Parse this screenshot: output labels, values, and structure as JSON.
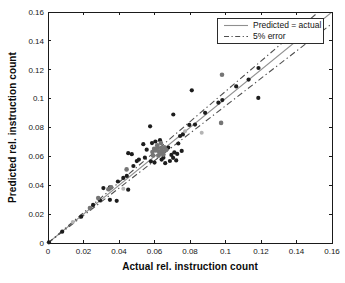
{
  "figure": {
    "xlabel": "Actual rel. instruction count",
    "ylabel": "Predicted rel. instruction count"
  },
  "legend": {
    "entries": [
      {
        "label": "Predicted = actual",
        "style": "solid"
      },
      {
        "label": "5% error",
        "style": "dashdot"
      }
    ]
  },
  "chart_data": {
    "type": "scatter",
    "title": "",
    "xlabel": "Actual rel. instruction count",
    "ylabel": "Predicted rel. instruction count",
    "xlim": [
      0,
      0.16
    ],
    "ylim": [
      0,
      0.16
    ],
    "grid": false,
    "legend_position": "top-right",
    "tick_values": [
      0,
      0.02,
      0.04,
      0.06,
      0.08,
      0.1,
      0.12,
      0.14,
      0.16
    ],
    "tick_labels": [
      "0",
      "0.02",
      "0.04",
      "0.06",
      "0.08",
      "0.1",
      "0.12",
      "0.14",
      "0.16"
    ],
    "lines": [
      {
        "name": "identity",
        "label": "Predicted = actual",
        "style": "solid",
        "slope": 1.0,
        "color": "#8f8f8f"
      },
      {
        "name": "plus-5pct",
        "label": "5% error",
        "style": "dashdot",
        "slope": 1.05,
        "color": "#4f4f4f"
      },
      {
        "name": "minus-5pct",
        "label": "5% error",
        "style": "dashdot",
        "slope": 0.95,
        "color": "#4f4f4f"
      }
    ],
    "point_colors": {
      "d": "#1d1d1d",
      "g": "#757575",
      "l": "#b4b4b4"
    },
    "point_radius": {
      "d": 2.1,
      "g": 2.3,
      "l": 2.0
    },
    "points": [
      [
        0.0005,
        0.0005,
        "d"
      ],
      [
        0.008,
        0.0078,
        "d"
      ],
      [
        0.0187,
        0.0182,
        "d"
      ],
      [
        0.0254,
        0.0264,
        "d"
      ],
      [
        0.0293,
        0.0296,
        "d"
      ],
      [
        0.0312,
        0.038,
        "d"
      ],
      [
        0.0349,
        0.0385,
        "d"
      ],
      [
        0.0349,
        0.0299,
        "d"
      ],
      [
        0.0387,
        0.0292,
        "d"
      ],
      [
        0.0452,
        0.0369,
        "d"
      ],
      [
        0.0394,
        0.0426,
        "d"
      ],
      [
        0.0424,
        0.0451,
        "d"
      ],
      [
        0.0444,
        0.0465,
        "d"
      ],
      [
        0.0452,
        0.0622,
        "d"
      ],
      [
        0.0472,
        0.0615,
        "d"
      ],
      [
        0.0481,
        0.0533,
        "d"
      ],
      [
        0.05,
        0.0567,
        "d"
      ],
      [
        0.0512,
        0.0578,
        "d"
      ],
      [
        0.0537,
        0.0684,
        "d"
      ],
      [
        0.0546,
        0.0591,
        "d"
      ],
      [
        0.0556,
        0.0646,
        "d"
      ],
      [
        0.058,
        0.0566,
        "d"
      ],
      [
        0.0586,
        0.0692,
        "d"
      ],
      [
        0.06,
        0.0557,
        "d"
      ],
      [
        0.0605,
        0.0703,
        "d"
      ],
      [
        0.0631,
        0.0712,
        "d"
      ],
      [
        0.064,
        0.0578,
        "d"
      ],
      [
        0.065,
        0.0591,
        "d"
      ],
      [
        0.066,
        0.0553,
        "d"
      ],
      [
        0.0678,
        0.0661,
        "d"
      ],
      [
        0.0687,
        0.0568,
        "d"
      ],
      [
        0.0695,
        0.061,
        "d"
      ],
      [
        0.0705,
        0.059,
        "d"
      ],
      [
        0.0712,
        0.0628,
        "d"
      ],
      [
        0.0722,
        0.0572,
        "d"
      ],
      [
        0.0728,
        0.0617,
        "d"
      ],
      [
        0.0734,
        0.0689,
        "d"
      ],
      [
        0.0753,
        0.0638,
        "d"
      ],
      [
        0.0575,
        0.0808,
        "d"
      ],
      [
        0.0706,
        0.089,
        "d"
      ],
      [
        0.0744,
        0.0741,
        "d"
      ],
      [
        0.076,
        0.0752,
        "d"
      ],
      [
        0.0796,
        0.0818,
        "d"
      ],
      [
        0.081,
        0.1058,
        "d"
      ],
      [
        0.0828,
        0.082,
        "d"
      ],
      [
        0.0885,
        0.0902,
        "d"
      ],
      [
        0.096,
        0.0972,
        "d"
      ],
      [
        0.0982,
        0.099,
        "d"
      ],
      [
        0.106,
        0.1085,
        "d"
      ],
      [
        0.113,
        0.1132,
        "d"
      ],
      [
        0.1185,
        0.1005,
        "d"
      ],
      [
        0.1186,
        0.1212,
        "d"
      ],
      [
        0.0236,
        0.0242,
        "g"
      ],
      [
        0.0283,
        0.0311,
        "g"
      ],
      [
        0.034,
        0.0372,
        "g"
      ],
      [
        0.0356,
        0.0386,
        "g"
      ],
      [
        0.0443,
        0.051,
        "g"
      ],
      [
        0.0588,
        0.063,
        "g"
      ],
      [
        0.0592,
        0.0606,
        "g"
      ],
      [
        0.0598,
        0.0652,
        "g"
      ],
      [
        0.0608,
        0.0641,
        "g"
      ],
      [
        0.0615,
        0.0676,
        "g"
      ],
      [
        0.0618,
        0.0662,
        "g"
      ],
      [
        0.0622,
        0.0605,
        "g"
      ],
      [
        0.0625,
        0.0636,
        "g"
      ],
      [
        0.0632,
        0.062,
        "g"
      ],
      [
        0.0636,
        0.0692,
        "g"
      ],
      [
        0.064,
        0.0655,
        "g"
      ],
      [
        0.0646,
        0.0632,
        "g"
      ],
      [
        0.065,
        0.0612,
        "g"
      ],
      [
        0.0655,
        0.0662,
        "g"
      ],
      [
        0.0665,
        0.0645,
        "g"
      ],
      [
        0.0975,
        0.0832,
        "g"
      ],
      [
        0.098,
        0.1165,
        "g"
      ],
      [
        0.014,
        0.0146,
        "l"
      ],
      [
        0.0424,
        0.0376,
        "l"
      ],
      [
        0.0772,
        0.0774,
        "l"
      ],
      [
        0.0866,
        0.0763,
        "l"
      ]
    ]
  }
}
